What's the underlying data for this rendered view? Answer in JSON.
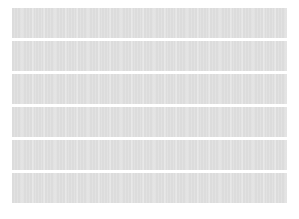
{
  "canvas": {
    "width": 299,
    "height": 219,
    "background_color": "#ffffff"
  },
  "placeholder": {
    "kind": "skeleton-loading-bars",
    "bar_color": "#dcdcdc",
    "gap_color": "#ffffff",
    "bar_count": 6,
    "bar_width_px": 275,
    "bar_height_px": 30,
    "bar_gap_px": 3,
    "left_margin_px": 12,
    "top_margin_px": 8,
    "items": [
      {
        "label": "",
        "index": "1"
      },
      {
        "label": "",
        "index": "2"
      },
      {
        "label": "",
        "index": "3"
      },
      {
        "label": "",
        "index": "4"
      },
      {
        "label": "",
        "index": "5"
      },
      {
        "label": "",
        "index": "6"
      }
    ]
  }
}
